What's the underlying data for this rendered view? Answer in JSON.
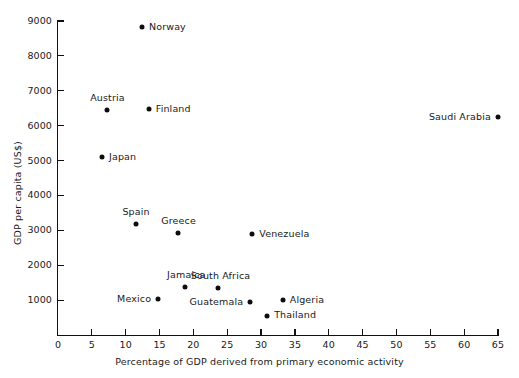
{
  "chart_data": {
    "type": "scatter",
    "title": "",
    "xlabel": "Percentage of GDP derived from primary economic activity",
    "ylabel": "GDP per capita (US$)",
    "xlim": [
      0,
      65
    ],
    "ylim": [
      0,
      9000
    ],
    "xticks": [
      0,
      5,
      10,
      15,
      20,
      25,
      30,
      35,
      40,
      45,
      50,
      55,
      60,
      65
    ],
    "yticks": [
      1000,
      2000,
      3000,
      4000,
      5000,
      6000,
      7000,
      8000,
      9000
    ],
    "grid": false,
    "legend": "none",
    "marker_color": "#0d0d0d",
    "points": [
      {
        "label": "Norway",
        "x": 12.4,
        "y": 8820,
        "label_side": "right"
      },
      {
        "label": "Austria",
        "x": 7.2,
        "y": 6440,
        "label_side": "above"
      },
      {
        "label": "Finland",
        "x": 13.4,
        "y": 6470,
        "label_side": "right"
      },
      {
        "label": "Saudi Arabia",
        "x": 65.0,
        "y": 6240,
        "label_side": "left"
      },
      {
        "label": "Japan",
        "x": 6.5,
        "y": 5100,
        "label_side": "right"
      },
      {
        "label": "Spain",
        "x": 11.5,
        "y": 3180,
        "label_side": "above"
      },
      {
        "label": "Greece",
        "x": 17.7,
        "y": 2920,
        "label_side": "above"
      },
      {
        "label": "Venezuela",
        "x": 28.7,
        "y": 2890,
        "label_side": "right"
      },
      {
        "label": "Jamaica",
        "x": 18.8,
        "y": 1375,
        "label_side": "above"
      },
      {
        "label": "South Africa",
        "x": 23.6,
        "y": 1345,
        "label_side": "above"
      },
      {
        "label": "Mexico",
        "x": 14.8,
        "y": 1030,
        "label_side": "left"
      },
      {
        "label": "Algeria",
        "x": 33.2,
        "y": 1000,
        "label_side": "right"
      },
      {
        "label": "Guatemala",
        "x": 28.4,
        "y": 945,
        "label_side": "left"
      },
      {
        "label": "Thailand",
        "x": 30.9,
        "y": 545,
        "label_side": "right"
      }
    ]
  }
}
